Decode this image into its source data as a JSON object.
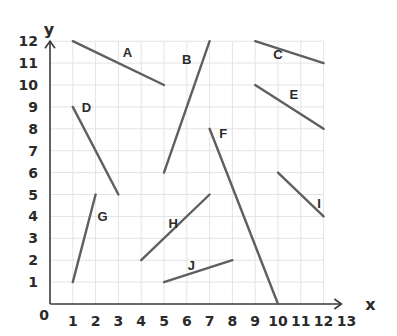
{
  "chart_data": {
    "type": "line",
    "title": "",
    "xlabel": "x",
    "ylabel": "y",
    "origin_label": "0",
    "x_ticks": [
      "1",
      "2",
      "3",
      "4",
      "5",
      "6",
      "7",
      "8",
      "9",
      "10",
      "11",
      "12",
      "13"
    ],
    "y_ticks": [
      "1",
      "2",
      "3",
      "4",
      "5",
      "6",
      "7",
      "8",
      "9",
      "10",
      "11",
      "12"
    ],
    "xlim": [
      0,
      13
    ],
    "ylim": [
      0,
      12
    ],
    "grid": true,
    "segments": [
      {
        "name": "A",
        "from": [
          1,
          12
        ],
        "to": [
          5,
          10
        ],
        "label_at": [
          3.4,
          11.5
        ]
      },
      {
        "name": "B",
        "from": [
          5,
          6
        ],
        "to": [
          7,
          12
        ],
        "label_at": [
          6.0,
          11.2
        ]
      },
      {
        "name": "C",
        "from": [
          9,
          12
        ],
        "to": [
          12,
          11
        ],
        "label_at": [
          10.0,
          11.4
        ]
      },
      {
        "name": "D",
        "from": [
          1,
          9
        ],
        "to": [
          3,
          5
        ],
        "label_at": [
          1.6,
          9.0
        ]
      },
      {
        "name": "E",
        "from": [
          9,
          10
        ],
        "to": [
          12,
          8
        ],
        "label_at": [
          10.7,
          9.6
        ]
      },
      {
        "name": "F",
        "from": [
          7,
          8
        ],
        "to": [
          10,
          0
        ],
        "label_at": [
          7.6,
          7.8
        ]
      },
      {
        "name": "G",
        "from": [
          1,
          1
        ],
        "to": [
          2,
          5
        ],
        "label_at": [
          2.3,
          4.0
        ]
      },
      {
        "name": "H",
        "from": [
          4,
          2
        ],
        "to": [
          7,
          5
        ],
        "label_at": [
          5.4,
          3.7
        ]
      },
      {
        "name": "I",
        "from": [
          10,
          6
        ],
        "to": [
          12,
          4
        ],
        "label_at": [
          11.8,
          4.6
        ]
      },
      {
        "name": "J",
        "from": [
          5,
          1
        ],
        "to": [
          8,
          2
        ],
        "label_at": [
          6.2,
          1.8
        ]
      }
    ]
  },
  "colors": {
    "segment": "#5f5f5f",
    "axis": "#3a3a3a",
    "grid": "#e4e4e4",
    "text": "#2a2a2a"
  }
}
